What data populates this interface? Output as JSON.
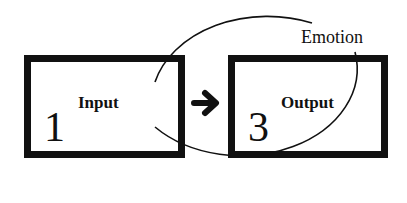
{
  "diagram": {
    "nodes": [
      {
        "id": "input",
        "number": "1",
        "label": "Input"
      },
      {
        "id": "output",
        "number": "3",
        "label": "Output"
      }
    ],
    "edges": [
      {
        "from": "input",
        "to": "output",
        "style": "bold-arrow"
      }
    ],
    "enclosure": {
      "label": "Emotion",
      "shape": "ellipse"
    }
  },
  "icons": {
    "arrow": "right-arrow-icon"
  },
  "colors": {
    "stroke": "#111111",
    "background": "#ffffff"
  }
}
